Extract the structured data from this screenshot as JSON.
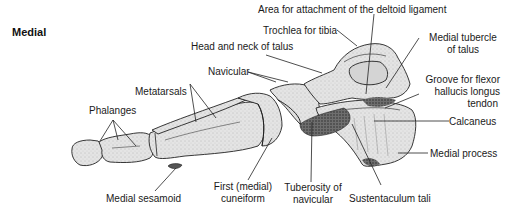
{
  "view_label": "Medial",
  "labels": {
    "deltoid": "Area for attachment of the deltoid ligament",
    "trochlea": "Trochlea for tibia",
    "medial_tubercle_1": "Medial tubercle",
    "medial_tubercle_2": "of talus",
    "head_neck": "Head and neck of talus",
    "navicular": "Navicular",
    "metatarsals": "Metatarsals",
    "groove_1": "Groove for flexor",
    "groove_2": "hallucis longus",
    "groove_3": "tendon",
    "phalanges": "Phalanges",
    "calcaneus": "Calcaneus",
    "medial_process": "Medial process",
    "medial_sesamoid": "Medial sesamoid",
    "first_cuneiform_1": "First (medial)",
    "first_cuneiform_2": "cuneiform",
    "tuberosity_1": "Tuberosity of",
    "tuberosity_2": "navicular",
    "sustentaculum": "Sustentaculum tali"
  },
  "colors": {
    "bone_fill": "#e6e6e6",
    "bone_shade": "#bdbdbd",
    "outline": "#222222",
    "leader": "#222222"
  }
}
